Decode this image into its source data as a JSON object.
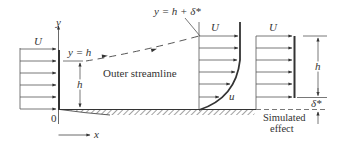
{
  "diagram": {
    "colors": {
      "line": "#333333",
      "thin_line": "#555555",
      "background": "#ffffff"
    },
    "labels": {
      "u_left": "U",
      "u_middle": "U",
      "u_right": "U",
      "y_axis": "y",
      "x_axis": "x",
      "origin": "0",
      "y_eq_h": "y = h",
      "y_eq_h_delta": "y = h + δ*",
      "h_left": "h",
      "h_right": "h",
      "delta_star": "δ*",
      "outer_streamline": "Outer streamline",
      "u_local": "u",
      "simulated_line1": "Simulated",
      "simulated_line2": "effect"
    },
    "profiles": {
      "inlet_uniform_arrow_count": 6,
      "boundary_layer_arrow_count": 6,
      "simulated_uniform_arrow_count": 6
    }
  }
}
